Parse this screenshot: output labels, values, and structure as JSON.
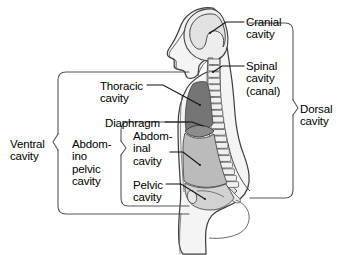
{
  "labels": {
    "cranial_cavity": "Cranial\ncavity",
    "spinal_cavity": "Spinal\ncavity\n(canal)",
    "dorsal_cavity": "Dorsal\ncavity",
    "ventral_cavity": "Ventral\ncavity",
    "abdominopelvic_cavity": "Abdom-\nino\npelvic\ncavity",
    "thoracic_cavity": "Thoracic\ncavity",
    "diaphragm": "Diaphragm",
    "abdominal_cavity": "Abdom-\ninal\ncavity",
    "pelvic_cavity": "Pelvic\ncavity"
  },
  "colors": {
    "background": "#ffffff",
    "outline": "#3a3a3a",
    "body_fill": "#f2f2f2",
    "body_fill_light": "#f7f7f7",
    "thoracic_fill": "#737373",
    "abdominal_fill": "#b9b9b9",
    "pelvic_fill": "#cfcfcf",
    "cranial_fill": "#e4e4e4",
    "spine_fill": "#dcdcdc",
    "bracket_stroke": "#4a4a4a",
    "leader_stroke": "#1a1a1a",
    "text": "#000000"
  },
  "regions": [
    {
      "name": "cranial-cavity",
      "group": "dorsal",
      "shade": "#e4e4e4"
    },
    {
      "name": "spinal-cavity",
      "group": "dorsal",
      "shade": "#dcdcdc"
    },
    {
      "name": "thoracic-cavity",
      "group": "ventral",
      "shade": "#737373"
    },
    {
      "name": "abdominal-cavity",
      "group": "ventral",
      "shade": "#b9b9b9"
    },
    {
      "name": "pelvic-cavity",
      "group": "ventral",
      "shade": "#cfcfcf"
    },
    {
      "name": "diaphragm",
      "group": "divider",
      "shade": "#8a8a8a"
    }
  ]
}
